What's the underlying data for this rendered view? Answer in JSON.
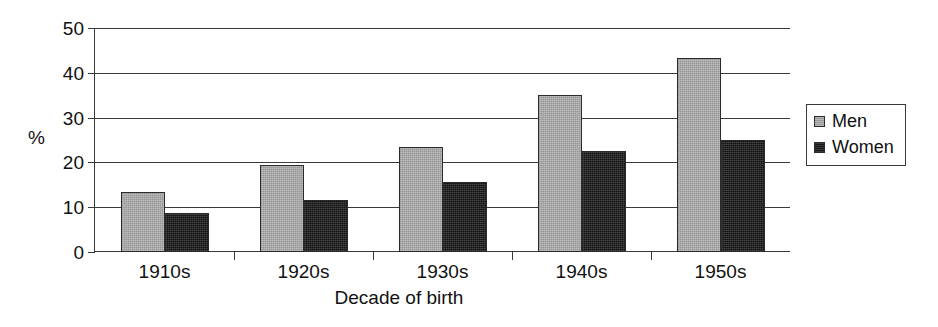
{
  "chart_data": {
    "type": "bar",
    "title": "",
    "subtitle": "",
    "xlabel": "Decade of birth",
    "ylabel": "%",
    "categories": [
      "1910s",
      "1920s",
      "1930s",
      "1940s",
      "1950s"
    ],
    "series": [
      {
        "name": "Men",
        "color": "#a8a8a8",
        "values": [
          13.3,
          19.5,
          23.5,
          35.0,
          43.3
        ]
      },
      {
        "name": "Women",
        "color": "#1f1f1f",
        "values": [
          8.7,
          11.7,
          15.7,
          22.5,
          25.0
        ]
      }
    ],
    "ylim": [
      0,
      50
    ],
    "yticks": [
      0,
      10,
      20,
      30,
      40,
      50
    ],
    "ytick_labels": [
      "0",
      "10",
      "20",
      "30",
      "40",
      "50"
    ],
    "grid": true,
    "grid_axis": "y",
    "legend_position": "right",
    "legend_entries": [
      "Men",
      "Women"
    ]
  },
  "axes": {
    "y_title": "%",
    "x_title": "Decade of birth"
  },
  "legend": {
    "items": [
      {
        "label": "Men"
      },
      {
        "label": "Women"
      }
    ]
  }
}
